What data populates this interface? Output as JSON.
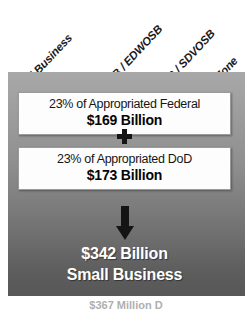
{
  "categories": [
    {
      "label": "Small Business",
      "left": 18,
      "bottom": 88,
      "size": 11.5
    },
    {
      "label": "8(a)",
      "left": 74,
      "bottom": 88,
      "size": 11.5
    },
    {
      "label": "WOSB / EDWOSB",
      "left": 100,
      "bottom": 88,
      "size": 11.5
    },
    {
      "label": "VOSB / SDVOSB",
      "left": 157,
      "bottom": 88,
      "size": 11.5
    },
    {
      "label": "HUBZone",
      "left": 205,
      "bottom": 88,
      "size": 11.5
    }
  ],
  "boxes": {
    "federal": {
      "description": "23% of Appropriated Federal",
      "amount": "$169 Billion"
    },
    "dod": {
      "description": "23% of Appropriated DoD",
      "amount": "$173 Billion"
    }
  },
  "operators": {
    "plus": "+",
    "arrow": "down-arrow"
  },
  "total": {
    "amount": "$342 Billion",
    "subject": "Small Business"
  },
  "caption": {
    "text": "$367 Million D"
  },
  "colors": {
    "panel_top": "#a8a8a8",
    "panel_bottom": "#575757",
    "box_background": "#fdfdfd",
    "box_border": "#9a9a9a",
    "label_text": "#1a1a1a",
    "total_text": "#ffffff"
  }
}
